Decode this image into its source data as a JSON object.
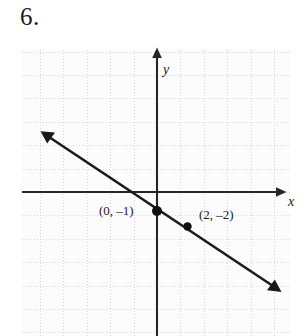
{
  "problem": {
    "number": "6."
  },
  "chart_data": {
    "type": "line",
    "title": "",
    "xlabel": "x",
    "ylabel": "y",
    "grid": true,
    "legend": false,
    "xlim": [
      -5.8,
      5.5
    ],
    "ylim": [
      -6.1,
      6.1
    ],
    "grid_step": 1,
    "axis_color": "#262626",
    "grid_color": "#d6d6d6",
    "line_color": "#1a1a1a",
    "point_color": "#111111",
    "background": "#fcfcfc",
    "series": [
      {
        "name": "line",
        "equation": "y = -0.5x - 1",
        "slope": -0.5,
        "intercept": -1,
        "x": [
          -5.0,
          5.3
        ],
        "y": [
          1.5,
          -3.65
        ],
        "arrow_start": true,
        "arrow_end": true
      }
    ],
    "points": [
      {
        "label": "(0, –1)",
        "x": 0,
        "y": -1
      },
      {
        "label": "(2, –2)",
        "x": 2,
        "y": -2
      }
    ],
    "annotations": [
      {
        "text": "(0, –1)",
        "x": -2.5,
        "y": -1.35
      },
      {
        "text": "(2, –2)",
        "x": 1.75,
        "y": -1.95
      },
      {
        "text": "y",
        "x": 0.3,
        "y": 5.0
      },
      {
        "text": "x",
        "x": 5.6,
        "y": -0.35
      }
    ]
  },
  "axes": {
    "y_label": "y",
    "x_label": "x"
  },
  "labels": {
    "point_1": "(0, –1)",
    "point_2": "(2, –2)"
  }
}
